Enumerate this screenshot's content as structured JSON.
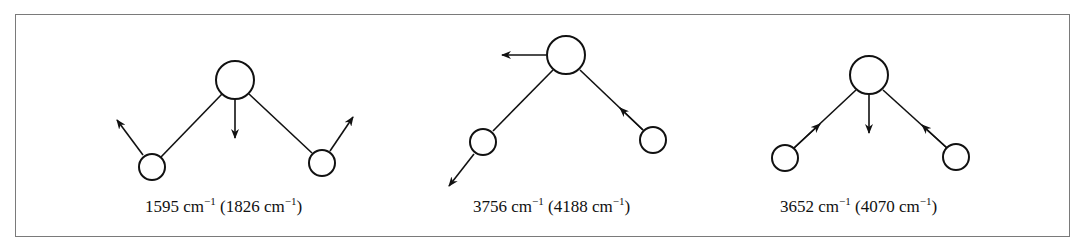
{
  "figure": {
    "colors": {
      "stroke": "#111111",
      "frame": "#7a7a7a",
      "background": "#ffffff"
    },
    "modes": [
      {
        "id": "mode-1",
        "name": "symmetric bend",
        "frequency": "1595",
        "frequency_alt": "1826",
        "unit": "cm",
        "exponent": "−1",
        "central_atom_motion": "down",
        "left_atom_motion": "up-left",
        "right_atom_motion": "up-right"
      },
      {
        "id": "mode-2",
        "name": "asymmetric stretch",
        "frequency": "3756",
        "frequency_alt": "4188",
        "unit": "cm",
        "exponent": "−1",
        "central_atom_motion": "left",
        "left_atom_motion": "down-left (away)",
        "right_atom_motion": "toward center along bond"
      },
      {
        "id": "mode-3",
        "name": "symmetric stretch",
        "frequency": "3652",
        "frequency_alt": "4070",
        "unit": "cm",
        "exponent": "−1",
        "central_atom_motion": "down",
        "left_atom_motion": "toward center along bond",
        "right_atom_motion": "toward center along bond"
      }
    ]
  }
}
